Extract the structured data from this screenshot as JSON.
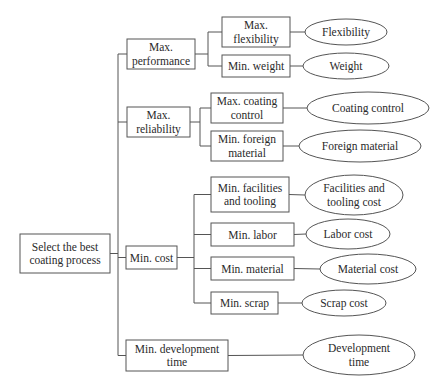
{
  "diagram": {
    "type": "objective-tree",
    "root": {
      "id": "root",
      "label": [
        "Select the best",
        "coating process"
      ]
    },
    "objectives": [
      {
        "id": "max-performance",
        "label": [
          "Max.",
          "performance"
        ],
        "subobjectives": [
          {
            "id": "max-flexibility",
            "label": [
              "Max.",
              "flexibility"
            ],
            "measure": [
              "Flexibility"
            ]
          },
          {
            "id": "min-weight",
            "label": [
              "Min. weight"
            ],
            "measure": [
              "Weight"
            ]
          }
        ]
      },
      {
        "id": "max-reliability",
        "label": [
          "Max.",
          "reliability"
        ],
        "subobjectives": [
          {
            "id": "max-coating-control",
            "label": [
              "Max. coating",
              "control"
            ],
            "measure": [
              "Coating control"
            ]
          },
          {
            "id": "min-foreign-material",
            "label": [
              "Min. foreign",
              "material"
            ],
            "measure": [
              "Foreign material"
            ]
          }
        ]
      },
      {
        "id": "min-cost",
        "label": [
          "Min. cost"
        ],
        "subobjectives": [
          {
            "id": "min-facilities-tooling",
            "label": [
              "Min. facilities",
              "and tooling"
            ],
            "measure": [
              "Facilities and",
              "tooling cost"
            ]
          },
          {
            "id": "min-labor",
            "label": [
              "Min. labor"
            ],
            "measure": [
              "Labor cost"
            ]
          },
          {
            "id": "min-material",
            "label": [
              "Min. material"
            ],
            "measure": [
              "Material cost"
            ]
          },
          {
            "id": "min-scrap",
            "label": [
              "Min. scrap"
            ],
            "measure": [
              "Scrap cost"
            ]
          }
        ]
      },
      {
        "id": "min-development-time",
        "label": [
          "Min. development",
          "time"
        ],
        "measure": [
          "Development",
          "time"
        ],
        "subobjectives": []
      }
    ],
    "colors": {
      "stroke": "#555555",
      "text": "#2a2a2a",
      "fill": "#ffffff"
    }
  }
}
